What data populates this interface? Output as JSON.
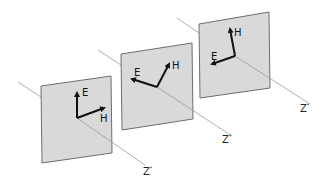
{
  "diagram": {
    "colors": {
      "plane_fill": "#d9d9d9",
      "plane_stroke": "#6e6e6e",
      "axis": "#9a9a9a",
      "vector": "#111111"
    },
    "planes": [
      {
        "id": 1,
        "e_label": "E",
        "h_label": "H",
        "z_label": "Z",
        "z_sup": "*"
      },
      {
        "id": 2,
        "e_label": "E",
        "h_label": "H",
        "z_label": "Z",
        "z_sup": "*"
      },
      {
        "id": 3,
        "e_label": "E",
        "h_label": "H",
        "z_label": "Z",
        "z_sup": "*"
      }
    ]
  }
}
